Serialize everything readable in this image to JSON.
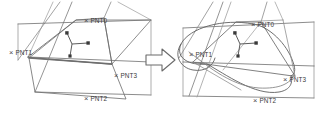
{
  "figure": {
    "name": "before-after-surface-deformation-diagram",
    "background_color": "#ffffff",
    "line_color": "#555555",
    "label_color": "#3a3a3a",
    "transition_icon": "right-arrow-icon"
  },
  "panels": [
    {
      "id": "left-panel",
      "caption": "",
      "point_labels": [
        {
          "name": "PNT0",
          "text": "PNT0",
          "marker": "x",
          "x": 92,
          "y": 20
        },
        {
          "name": "PNT1",
          "text": "PNT1",
          "marker": "x",
          "x": 16,
          "y": 52
        },
        {
          "name": "PNT2",
          "text": "PNT2",
          "marker": "x",
          "x": 92,
          "y": 98
        },
        {
          "name": "PNT3",
          "text": "PNT3",
          "marker": "x",
          "x": 122,
          "y": 75
        }
      ]
    },
    {
      "id": "right-panel",
      "caption": "",
      "point_labels": [
        {
          "name": "PNT0",
          "text": "PNT0",
          "marker": "x",
          "x": 258,
          "y": 24
        },
        {
          "name": "PNT1",
          "text": "PNT1",
          "marker": "x",
          "x": 196,
          "y": 54
        },
        {
          "name": "PNT2",
          "text": "PNT2",
          "marker": "x",
          "x": 260,
          "y": 100
        },
        {
          "name": "PNT3",
          "text": "PNT3",
          "marker": "x",
          "x": 290,
          "y": 79
        }
      ]
    }
  ],
  "markers": {
    "x_glyph": "×",
    "axis_triad_name": "coordinate-triad-marker"
  }
}
